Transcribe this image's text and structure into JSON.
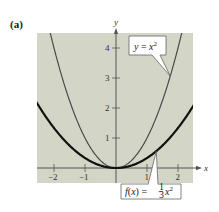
{
  "panel_label": "(a)",
  "colors": {
    "plot_bg": "#d3d5c7",
    "axis": "#555555",
    "curve_bold": "#111111",
    "curve_thin": "#4a4a4a",
    "callout_bg": "#ffffff",
    "callout_border": "#666666"
  },
  "chart_data": {
    "type": "line",
    "title": "",
    "xlabel": "x",
    "ylabel": "y",
    "xlim": [
      -2.55,
      2.5
    ],
    "ylim": [
      -0.5,
      4.5
    ],
    "grid": false,
    "x_ticks": [
      -2,
      -1,
      1,
      2
    ],
    "x_tick_labels": [
      "-2",
      "-1",
      "1",
      "2"
    ],
    "y_ticks": [
      1,
      2,
      3,
      4
    ],
    "y_tick_labels": [
      "1",
      "2",
      "3",
      "4"
    ],
    "series": [
      {
        "name": "y = x^2",
        "label": "y = x²",
        "style": "thin",
        "x": [
          -2.1,
          -2,
          -1.5,
          -1,
          -0.5,
          0,
          0.5,
          1,
          1.5,
          2,
          2.1
        ],
        "y": [
          4.41,
          4,
          2.25,
          1,
          0.25,
          0,
          0.25,
          1,
          2.25,
          4,
          4.41
        ]
      },
      {
        "name": "f(x) = (1/3) x^2",
        "label": "f(x) = ⅓x²",
        "style": "bold",
        "x": [
          -2.55,
          -2,
          -1.5,
          -1,
          -0.5,
          0,
          0.5,
          1,
          1.5,
          2,
          2.5
        ],
        "y": [
          2.17,
          1.33,
          0.75,
          0.33,
          0.08,
          0,
          0.08,
          0.33,
          0.75,
          1.33,
          2.08
        ]
      }
    ],
    "annotations": [
      {
        "text": "y = x²",
        "points_to": [
          1.75,
          3.06
        ]
      },
      {
        "text": "f(x) = ⅓x²",
        "points_to": [
          1.3,
          0.56
        ]
      }
    ]
  },
  "callouts": {
    "top": {
      "lhs": "y",
      "eq": " = ",
      "rhs": "x",
      "sup": "2"
    },
    "bottom": {
      "lhs": "f",
      "paren": "(x)",
      "eq": " = ",
      "num": "1",
      "den": "3",
      "rhs": "x",
      "sup": "2"
    }
  }
}
